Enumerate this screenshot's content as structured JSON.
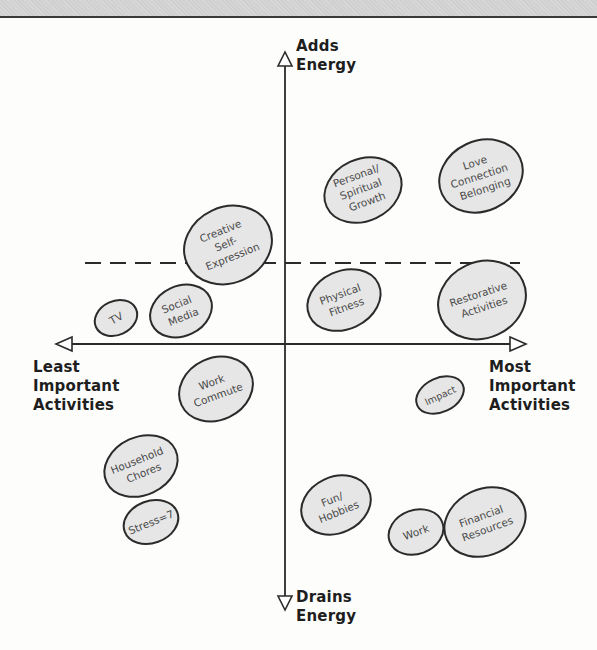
{
  "axes": {
    "top": {
      "line1": "Adds",
      "line2": "Energy"
    },
    "bottom": {
      "line1": "Drains",
      "line2": "Energy"
    },
    "left": {
      "line1": "Least",
      "line2": "Important",
      "line3": "Activities"
    },
    "right": {
      "line1": "Most",
      "line2": "Important",
      "line3": "Activities"
    }
  },
  "colors": {
    "bubble_fill": "#e6e6e6",
    "bubble_stroke": "#2b2b2b",
    "axis": "#2b2b2b",
    "text": "#1e1e1e"
  },
  "bubbles": [
    {
      "id": "creative",
      "lines": [
        "Creative",
        "Self-",
        "Expression"
      ]
    },
    {
      "id": "personal",
      "lines": [
        "Personal/",
        "Spiritual",
        "Growth"
      ]
    },
    {
      "id": "love",
      "lines": [
        "Love",
        "Connection",
        "Belonging"
      ]
    },
    {
      "id": "tv",
      "lines": [
        "TV"
      ]
    },
    {
      "id": "social",
      "lines": [
        "Social",
        "Media"
      ]
    },
    {
      "id": "physical",
      "lines": [
        "Physical",
        "Fitness"
      ]
    },
    {
      "id": "restorative",
      "lines": [
        "Restorative",
        "Activities"
      ]
    },
    {
      "id": "commute",
      "lines": [
        "Work",
        "Commute"
      ]
    },
    {
      "id": "impact",
      "lines": [
        "Impact"
      ]
    },
    {
      "id": "household",
      "lines": [
        "Household",
        "Chores"
      ]
    },
    {
      "id": "stress",
      "lines": [
        "Stress=7"
      ]
    },
    {
      "id": "fun",
      "lines": [
        "Fun/",
        "Hobbies"
      ]
    },
    {
      "id": "work",
      "lines": [
        "Work"
      ]
    },
    {
      "id": "financial",
      "lines": [
        "Financial",
        "Resources"
      ]
    }
  ]
}
